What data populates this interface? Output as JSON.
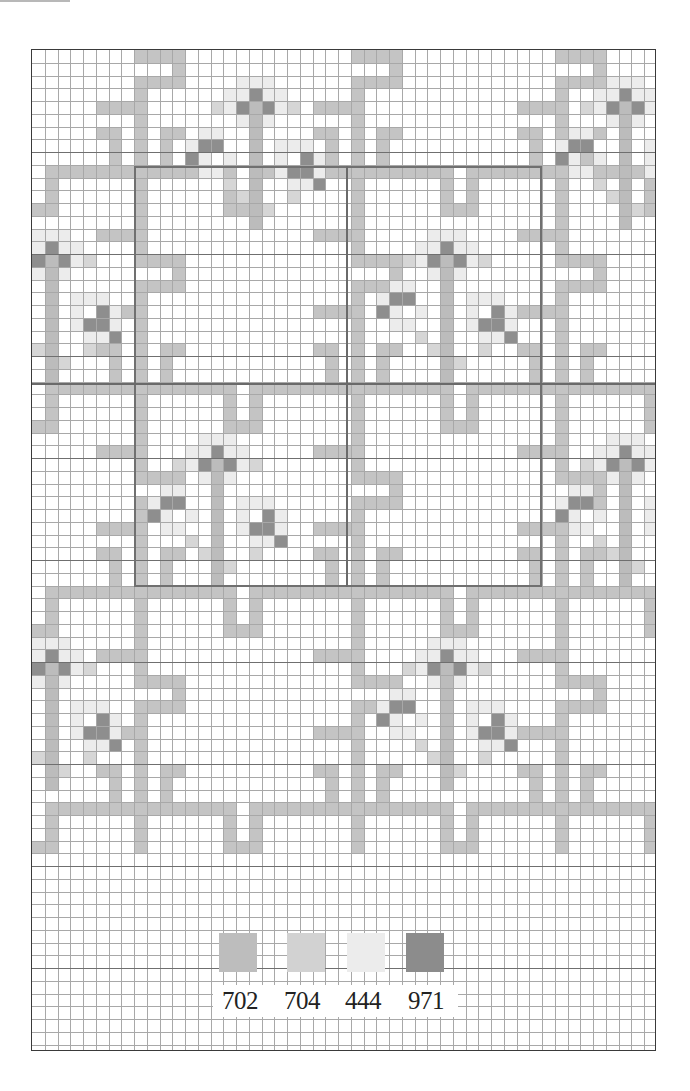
{
  "chart_data": {
    "type": "table",
    "title": "",
    "grid": {
      "cols": 49,
      "rows": 79,
      "cell_px": 12.75,
      "major_every": 8
    },
    "legend": [
      {
        "code": "702",
        "color": "#bdbdbd"
      },
      {
        "code": "704",
        "color": "#d2d2d2"
      },
      {
        "code": "444",
        "color": "#ececec"
      },
      {
        "code": "971",
        "color": "#8c8c8c"
      }
    ]
  },
  "colors": {
    "band": "#c4c4c4",
    "band_light": "#d6d6d6",
    "petal_light": "#ececec",
    "petal_dark": "#8e8e8e",
    "stem": "#bcbcbc",
    "grid_minor": "#a8a8a8",
    "grid_major": "#6f6f6f"
  },
  "lattice": {
    "v_lines": [
      8,
      24,
      40
    ],
    "h_lines": [
      9,
      26,
      42,
      59
    ],
    "period": 16.5
  },
  "flowers": [
    {
      "col": 17,
      "row": 2,
      "clip": "top"
    },
    {
      "col": 46,
      "row": 2,
      "clip": "top"
    },
    {
      "col": 1,
      "row": 14
    },
    {
      "col": 32,
      "row": 14
    },
    {
      "col": 14,
      "row": 30
    },
    {
      "col": 46,
      "row": 30
    },
    {
      "col": 1,
      "row": 46
    },
    {
      "col": 32,
      "row": 46
    }
  ],
  "legend_labels": {
    "l0": "702",
    "l1": "704",
    "l2": "444",
    "l3": "971"
  }
}
